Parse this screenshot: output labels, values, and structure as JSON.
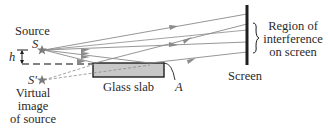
{
  "labels": {
    "source": "Source",
    "s": "S",
    "h": "h",
    "s_prime": "S′",
    "virtual_line1": "Virtual",
    "virtual_line2": "image",
    "virtual_line3": "of source",
    "glass_slab": "Glass slab",
    "a": "A",
    "screen": "Screen",
    "region_line1": "Region of",
    "region_line2": "interference",
    "region_line3": "on screen"
  },
  "colors": {
    "ray": "#8a8a8a",
    "slab_fill": "#c8c8c8",
    "outline": "#1e1e1e",
    "star": "#7a7a7a",
    "text": "#2a2a2a"
  }
}
